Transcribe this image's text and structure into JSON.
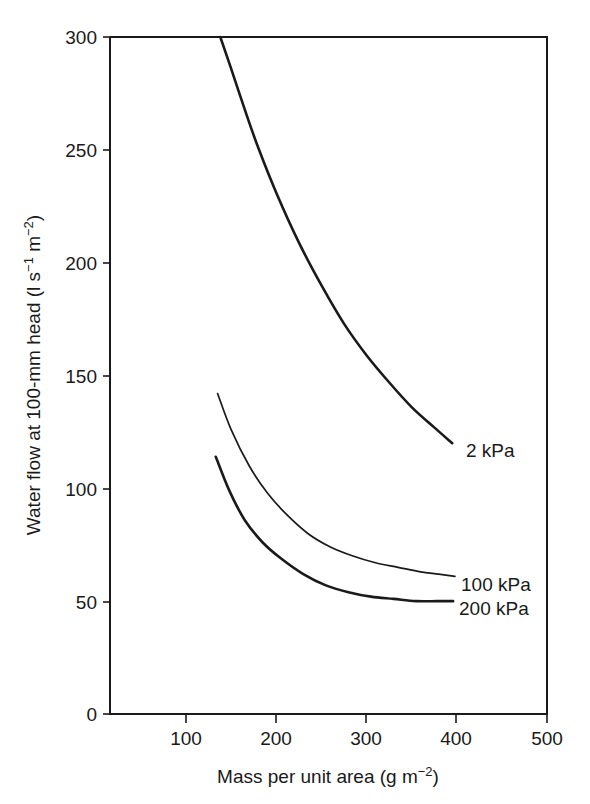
{
  "chart_data": {
    "type": "line",
    "title": "",
    "xlabel": "Mass per unit area (g  m−2)",
    "xlabel_main": "Mass per unit area (g  m",
    "xlabel_sup": "−2",
    "xlabel_tail": ")",
    "ylabel": "Water flow at 100-mm head (l s−1 m−2)",
    "ylabel_part1": "Water flow at 100-mm head (l s",
    "ylabel_sup1": "−1",
    "ylabel_part2": " m",
    "ylabel_sup2": "−2",
    "ylabel_tail": ")",
    "xlim": [
      0,
      500
    ],
    "ylim": [
      0,
      300
    ],
    "xticks": [
      0,
      100,
      200,
      300,
      400,
      500
    ],
    "xtick_labels": [
      "0",
      "100",
      "200",
      "300",
      "400",
      "500"
    ],
    "yticks": [
      0,
      50,
      100,
      150,
      200,
      250,
      300
    ],
    "ytick_labels": [
      "0",
      "50",
      "100",
      "150",
      "200",
      "250",
      "300"
    ],
    "grid": false,
    "legend_position": "inline-right-of-curve-end",
    "series": [
      {
        "name": "2 kPa",
        "label": "2 kPa",
        "stroke": "#1a1a1a",
        "width": "thick",
        "x": [
          138,
          150,
          165,
          180,
          200,
          225,
          250,
          275,
          300,
          325,
          350,
          375,
          395
        ],
        "y": [
          300,
          286,
          268,
          251,
          231,
          209,
          190,
          173,
          159,
          147,
          136,
          127,
          120
        ]
      },
      {
        "name": "100 kPa",
        "label": "100 kPa",
        "stroke": "#1a1a1a",
        "width": "thin",
        "x": [
          135,
          150,
          170,
          190,
          210,
          235,
          260,
          285,
          310,
          335,
          360,
          380,
          398
        ],
        "y": [
          142,
          126,
          110,
          98,
          89,
          80,
          74,
          70,
          67,
          65,
          63,
          62,
          61
        ]
      },
      {
        "name": "200 kPa",
        "label": "200 kPa",
        "stroke": "#1a1a1a",
        "width": "thick",
        "x": [
          133,
          148,
          165,
          185,
          205,
          230,
          255,
          280,
          305,
          330,
          355,
          378,
          396
        ],
        "y": [
          114,
          99,
          86,
          76,
          69,
          62,
          57,
          54,
          52,
          51,
          50,
          50,
          50
        ]
      }
    ]
  }
}
